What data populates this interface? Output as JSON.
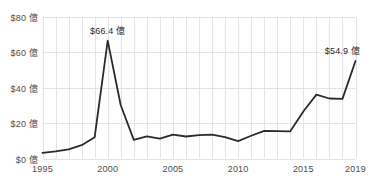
{
  "chart_data": {
    "type": "line",
    "title": "",
    "subtitle": "",
    "xlabel": "",
    "ylabel": "",
    "xlim": [
      1995,
      2019
    ],
    "ylim": [
      0,
      80
    ],
    "grid": true,
    "legend": "none",
    "y_ticks": [
      0,
      20,
      40,
      60,
      80
    ],
    "y_tick_labels": [
      "$0 億",
      "$20 億",
      "$40 億",
      "$60 億",
      "$80 億"
    ],
    "x_ticks": [
      1995,
      2000,
      2005,
      2010,
      2015,
      2019
    ],
    "x_tick_labels": [
      "1995",
      "2000",
      "2005",
      "2010",
      "2015",
      "2019"
    ],
    "series": [
      {
        "name": "",
        "color": "#2b2b2b",
        "x": [
          1995,
          1996,
          1997,
          1998,
          1999,
          2000,
          2001,
          2002,
          2003,
          2004,
          2005,
          2006,
          2007,
          2008,
          2009,
          2010,
          2011,
          2012,
          2013,
          2014,
          2015,
          2016,
          2017,
          2018,
          2019
        ],
        "values": [
          3.2,
          4.0,
          5.2,
          7.5,
          12.0,
          66.4,
          30.0,
          10.5,
          12.5,
          11.2,
          13.5,
          12.4,
          13.2,
          13.4,
          12.0,
          9.8,
          12.8,
          15.6,
          15.4,
          15.3,
          26.5,
          36.0,
          33.8,
          33.6,
          54.9
        ]
      }
    ],
    "annotations": [
      {
        "label": "$66.4 億",
        "x": 2000,
        "y": 66.4,
        "position": "above"
      },
      {
        "label": "$54.9 億",
        "x": 2018,
        "y": 54.9,
        "position": "above-left"
      }
    ],
    "colors": {
      "line": "#2b2b2b",
      "grid": "#e3e3e8",
      "axis_text": "#4d4d4d",
      "annotation_text": "#2b2b2b",
      "background": "#ffffff"
    }
  }
}
